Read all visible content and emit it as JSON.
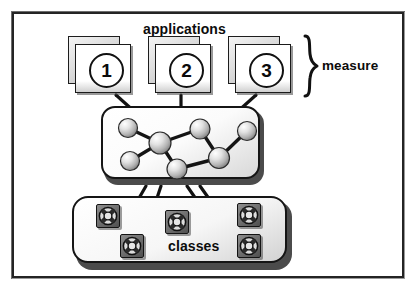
{
  "figure": {
    "type": "process-diagram",
    "title_visible": false,
    "frame": {
      "border_color": "#242424",
      "background": "#ffffff"
    }
  },
  "labels": {
    "applications": "applications",
    "measure": "measure",
    "classes": "classes"
  },
  "applications": {
    "group_label": "applications",
    "bracket_label": "measure",
    "cards": [
      {
        "number": "1",
        "name": "application-card-1"
      },
      {
        "number": "2",
        "name": "application-card-2"
      },
      {
        "number": "3",
        "name": "application-card-3"
      }
    ]
  },
  "graph": {
    "name": "measure-graph-panel",
    "node_count": 7,
    "edge_count": 7,
    "nodes": [
      {
        "id": "n1",
        "cx": 27,
        "cy": 22,
        "r": 9.5
      },
      {
        "id": "n2",
        "cx": 59,
        "cy": 37,
        "r": 11
      },
      {
        "id": "n3",
        "cx": 29,
        "cy": 55,
        "r": 9.5
      },
      {
        "id": "n4",
        "cx": 99,
        "cy": 23,
        "r": 10
      },
      {
        "id": "n5",
        "cx": 146,
        "cy": 25,
        "r": 9.5
      },
      {
        "id": "n6",
        "cx": 118,
        "cy": 52,
        "r": 10.5
      },
      {
        "id": "n7",
        "cx": 76,
        "cy": 63,
        "r": 10
      }
    ],
    "edges": [
      [
        "n1",
        "n2"
      ],
      [
        "n2",
        "n3"
      ],
      [
        "n2",
        "n4"
      ],
      [
        "n4",
        "n6"
      ],
      [
        "n6",
        "n5"
      ],
      [
        "n6",
        "n7"
      ],
      [
        "n7",
        "n2"
      ]
    ]
  },
  "classes": {
    "panel_label": "classes",
    "icons": [
      {
        "name": "class-icon-1",
        "x": 24,
        "y": 8
      },
      {
        "name": "class-icon-2",
        "x": 93,
        "y": 14
      },
      {
        "name": "class-icon-3",
        "x": 165,
        "y": 7
      },
      {
        "name": "class-icon-4",
        "x": 48,
        "y": 38
      },
      {
        "name": "class-icon-5",
        "x": 165,
        "y": 38
      }
    ]
  },
  "connectors": {
    "applications_to_graph": [
      {
        "from": "application-card-1",
        "x1": 116,
        "y1": 95,
        "x2": 136,
        "y2": 113
      },
      {
        "from": "application-card-2",
        "x1": 181,
        "y1": 95,
        "x2": 181,
        "y2": 110
      },
      {
        "from": "application-card-3",
        "x1": 256,
        "y1": 95,
        "x2": 236,
        "y2": 113
      }
    ],
    "graph_to_classes": [
      {
        "x1": 146,
        "y1": 186,
        "x2": 131,
        "y2": 212
      },
      {
        "x1": 161,
        "y1": 186,
        "x2": 151,
        "y2": 216
      },
      {
        "x1": 187,
        "y1": 186,
        "x2": 205,
        "y2": 212
      },
      {
        "x1": 200,
        "y1": 186,
        "x2": 222,
        "y2": 217
      }
    ]
  },
  "colors": {
    "ink": "#111111",
    "frame": "#242424",
    "panel_fill": "#ffffff",
    "panel_shadow": "#4b4b4b",
    "node_fill": "#d8d8d8",
    "icon_dark": "#5a5a5a"
  }
}
